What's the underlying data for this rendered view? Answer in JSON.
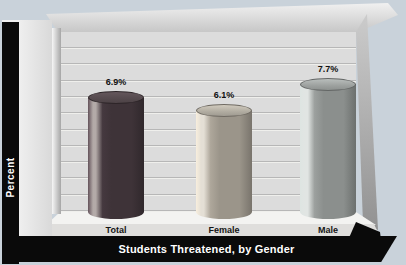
{
  "chart_data": {
    "type": "bar",
    "style": "3d-cylinder-bars",
    "title": "Students Threatened, by Gender",
    "xlabel": "Students Threatened, by Gender",
    "ylabel": "Percent",
    "ylim": [
      0,
      10
    ],
    "yticks": [
      0,
      1,
      2,
      3,
      4,
      5,
      6,
      7,
      8,
      9,
      10
    ],
    "grid": true,
    "legend": false,
    "categories": [
      "Total",
      "Female",
      "Male"
    ],
    "values": [
      6.9,
      6.1,
      7.7
    ],
    "value_labels": [
      "6.9%",
      "6.1%",
      "7.7%"
    ],
    "bar_colors": [
      {
        "base": "#3e3338",
        "highlight": "#b3aaa8",
        "top": "#554a4e"
      },
      {
        "base": "#9b958a",
        "highlight": "#e4dfd5",
        "top": "#b1aca1"
      },
      {
        "base": "#8b8f8d",
        "highlight": "#e1e5e3",
        "top": "#9da19f"
      }
    ]
  },
  "colors": {
    "background": "#c9d2da",
    "frame": "#0a0a0a",
    "wall": "#dcdcdc",
    "gridline": "#b7b7b7",
    "tick_text": "#141414",
    "banner_text": "#ffffff"
  }
}
